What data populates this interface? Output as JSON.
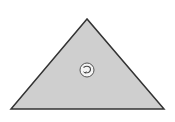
{
  "diagram": {
    "shape": "triangle",
    "fill": "#cfcfcf",
    "stroke": "#333333",
    "vertices": {
      "apex": [
        87,
        19
      ],
      "bottom_left": [
        11,
        109
      ],
      "bottom_right": [
        164,
        109
      ]
    },
    "center_icon": {
      "name": "rotate-arrow-icon",
      "glyph": "↻",
      "cx": 87,
      "cy": 70,
      "r": 7
    }
  }
}
